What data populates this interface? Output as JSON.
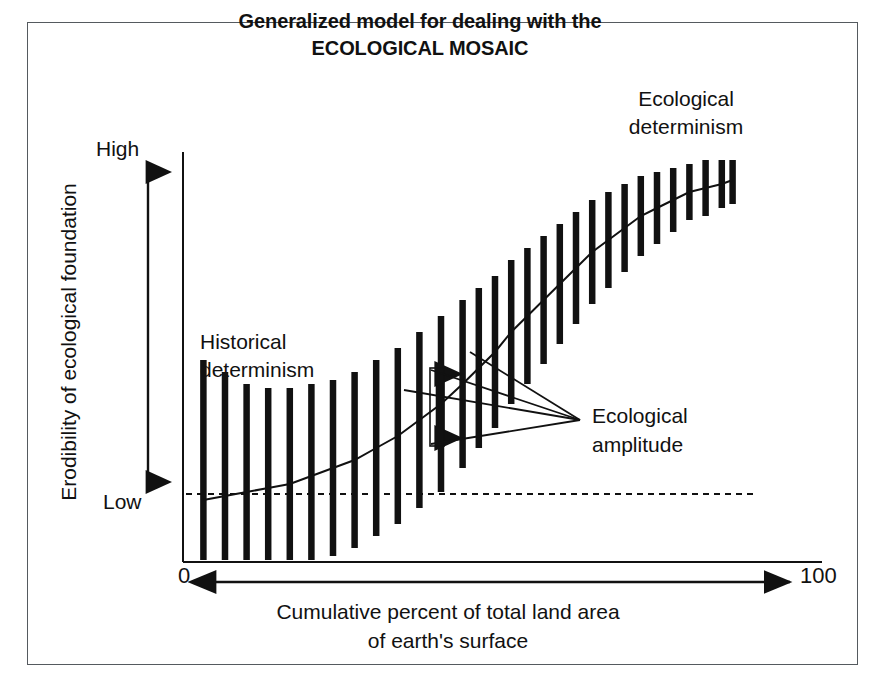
{
  "figure": {
    "title_line1": "Generalized model for dealing with the",
    "title_line2": "ECOLOGICAL MOSAIC",
    "frame_color": "#555a5f",
    "ink_color": "#111111",
    "background": "#ffffff"
  },
  "annotations": {
    "ecological_determinism_line1": "Ecological",
    "ecological_determinism_line2": "determinism",
    "historical_determinism_line1": "Historical",
    "historical_determinism_line2": "determinism",
    "ecological_amplitude_line1": "Ecological",
    "ecological_amplitude_line2": "amplitude"
  },
  "axes": {
    "y_title": "Erodibility of ecological foundation",
    "y_high": "High",
    "y_low": "Low",
    "x_title_line1": "Cumulative percent of total land area",
    "x_title_line2": "of earth's surface",
    "x_min_label": "0",
    "x_max_label": "100"
  },
  "chart_data": {
    "type": "line",
    "title": "Generalized model for dealing with the ECOLOGICAL MOSAIC",
    "xlabel": "Cumulative percent of total land area of earth's surface",
    "ylabel": "Erodibility of ecological foundation",
    "xlim": [
      0,
      100
    ],
    "ylim": [
      0,
      100
    ],
    "xtick_labels": [
      "0",
      "100"
    ],
    "ytick_labels": [
      "Low",
      "High"
    ],
    "grid": false,
    "legend": false,
    "reference_line": {
      "orientation": "horizontal",
      "y": 17,
      "style": "dashed"
    },
    "series": [
      {
        "name": "Mean erodibility",
        "x": [
          1,
          5,
          9,
          13,
          17,
          21,
          25,
          29,
          33,
          37,
          41,
          45,
          49,
          52,
          55,
          58,
          61,
          64,
          67,
          70,
          73,
          76,
          79,
          82,
          85,
          88,
          91,
          94,
          97,
          99
        ],
        "y": [
          15,
          16,
          17,
          18,
          19,
          21,
          23,
          25,
          28,
          31,
          35,
          39,
          44,
          48,
          52,
          57,
          61,
          65,
          69,
          73,
          77,
          80,
          83,
          86,
          88,
          90,
          92,
          93,
          94,
          95
        ]
      }
    ],
    "error_bars": {
      "name": "Ecological amplitude",
      "x": [
        1,
        5,
        9,
        13,
        17,
        21,
        25,
        29,
        33,
        37,
        41,
        45,
        49,
        52,
        55,
        58,
        61,
        64,
        67,
        70,
        73,
        76,
        79,
        82,
        85,
        88,
        91,
        94,
        97,
        99
      ],
      "half_width": [
        35,
        31,
        27,
        25,
        24,
        23,
        22,
        22,
        22,
        22,
        22,
        22,
        21,
        20,
        19,
        18,
        17,
        16,
        15,
        14,
        13,
        12,
        11,
        10,
        9,
        8,
        7,
        7,
        6,
        6
      ]
    },
    "highlighted_amplitude": {
      "x": 45,
      "label": "Ecological amplitude"
    }
  }
}
